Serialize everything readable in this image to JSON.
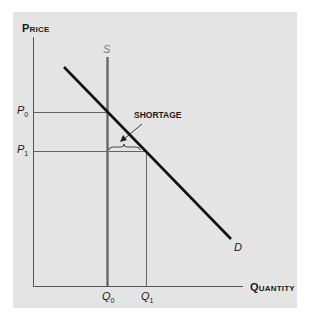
{
  "diagram": {
    "y_axis_label": "Price",
    "x_axis_label": "Quantity",
    "supply_label": "S",
    "demand_label": "D",
    "price_levels": [
      {
        "label": "P",
        "sub": "0"
      },
      {
        "label": "P",
        "sub": "1"
      }
    ],
    "quantity_levels": [
      {
        "label": "Q",
        "sub": "0"
      },
      {
        "label": "Q",
        "sub": "1"
      }
    ],
    "annotation": "SHORTAGE",
    "colors": {
      "panel_bg": "#e4e4e4",
      "demand": "#111111",
      "supply": "#666666",
      "guides": "#555555"
    }
  }
}
